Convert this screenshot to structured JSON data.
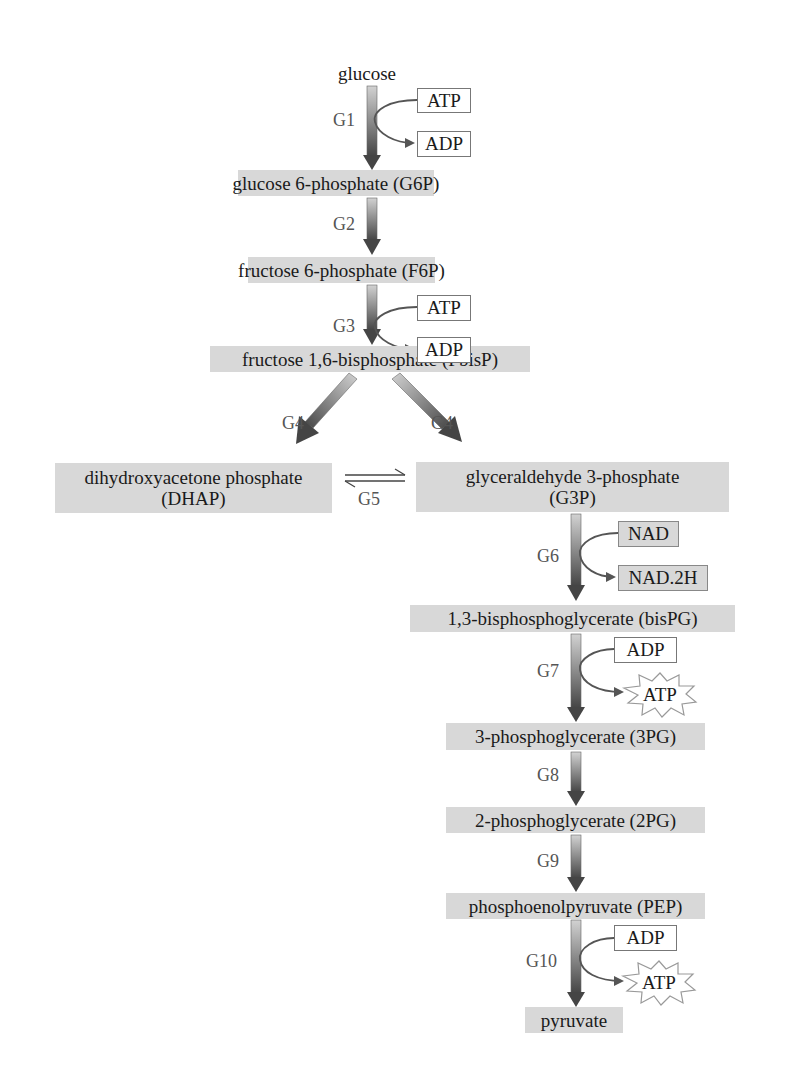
{
  "metabolites": {
    "glucose": "glucose",
    "g6p": "glucose 6-phosphate (G6P)",
    "f6p": "fructose 6-phosphate (F6P)",
    "fbisp": "fructose 1,6-bisphosphate (FbisP)",
    "dhap_line1": "dihydroxyacetone phosphate",
    "dhap_line2": "(DHAP)",
    "g3p_line1": "glyceraldehyde 3-phosphate",
    "g3p_line2": "(G3P)",
    "bispg": "1,3-bisphosphoglycerate (bisPG)",
    "pg3": "3-phosphoglycerate (3PG)",
    "pg2": "2-phosphoglycerate (2PG)",
    "pep": "phosphoenolpyruvate (PEP)",
    "pyruvate": "pyruvate"
  },
  "steps": {
    "g1": "G1",
    "g2": "G2",
    "g3": "G3",
    "g4_left": "G4",
    "g4_right": "G4",
    "g5": "G5",
    "g6": "G6",
    "g7": "G7",
    "g8": "G8",
    "g9": "G9",
    "g10": "G10"
  },
  "cofactors": {
    "g1_in": "ATP",
    "g1_out": "ADP",
    "g3_in": "ATP",
    "g3_out": "ADP",
    "g6_in": "NAD",
    "g6_out": "NAD.2H",
    "g7_in": "ADP",
    "g7_out": "ATP",
    "g10_in": "ADP",
    "g10_out": "ATP"
  },
  "colors": {
    "metabolite_box": "#d8d8d8",
    "arrow_dark": "#4a4a4a",
    "arrow_light": "#cfcfcf",
    "step_label": "#555555"
  }
}
